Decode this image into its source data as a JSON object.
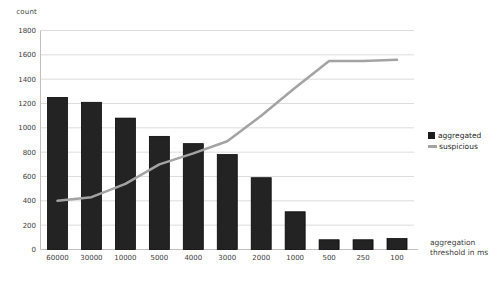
{
  "chart_data": {
    "type": "bar",
    "subtype": "bar-and-line-combo",
    "title": "",
    "ylabel": "count",
    "xlabel": "aggregation threshold in ms",
    "xlabel_lines": [
      "aggregation",
      "threshold in ms"
    ],
    "categories": [
      "60000",
      "30000",
      "10000",
      "5000",
      "4000",
      "3000",
      "2000",
      "1000",
      "500",
      "250",
      "100"
    ],
    "series": [
      {
        "name": "aggregated",
        "kind": "bar",
        "color": "#232323",
        "values": [
          1250,
          1210,
          1080,
          930,
          870,
          780,
          590,
          310,
          80,
          80,
          90
        ]
      },
      {
        "name": "suspicious",
        "kind": "line",
        "color": "#a3a3a3",
        "values": [
          400,
          430,
          540,
          700,
          790,
          890,
          1100,
          1330,
          1550,
          1550,
          1560
        ]
      }
    ],
    "ylim": [
      0,
      1800
    ],
    "y_ticks": [
      0,
      200,
      400,
      600,
      800,
      1000,
      1200,
      1400,
      1600,
      1800
    ],
    "grid": "horizontal",
    "legend_position": "right",
    "colors": {
      "background": "#ffffff",
      "grid": "#dcdcdc",
      "axis": "#c0c0c0",
      "tick_text": "#3d3d3d",
      "bar_fill": "#232323",
      "bar_border": "#000000",
      "line": "#a3a3a3"
    }
  }
}
